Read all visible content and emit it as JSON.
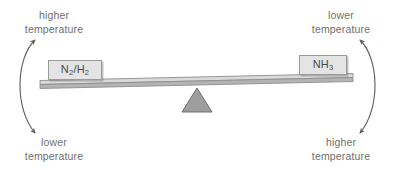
{
  "diagram": {
    "labels": {
      "top_left": {
        "line1": "higher",
        "line2": "temperature"
      },
      "top_right": {
        "line1": "lower",
        "line2": "temperature"
      },
      "bottom_left": {
        "line1": "lower",
        "line2": "temperature"
      },
      "bottom_right": {
        "line1": "higher",
        "line2": "temperature"
      }
    },
    "boxes": {
      "left": {
        "formula_html": "N<sub>2</sub>/H<sub>2</sub>",
        "formula_text": "N2/H2"
      },
      "right": {
        "formula_html": "NH<sub>3</sub>",
        "formula_text": "NH3"
      }
    },
    "arrows": {
      "left": {
        "name": "curved-double-arrow-left",
        "description": "double-headed curved arrow bowing left"
      },
      "right": {
        "name": "curved-double-arrow-right",
        "description": "double-headed curved arrow bowing right"
      }
    },
    "balance": {
      "beam": {
        "name": "seesaw-beam",
        "tilt": "left side down, right side up"
      },
      "fulcrum": {
        "name": "triangular-fulcrum",
        "shape": "triangle"
      }
    },
    "colors": {
      "text": "#6f6f6f",
      "box_fill": "#e4e4e4",
      "box_border": "#9a9a9a",
      "beam_face": "#d0d0d0",
      "beam_edge": "#8d8d8d",
      "fulcrum_fill": "#9e9e9e",
      "fulcrum_stroke": "#6e6e6e",
      "arrow_stroke": "#5f5f5f",
      "background": "#ffffff"
    }
  }
}
